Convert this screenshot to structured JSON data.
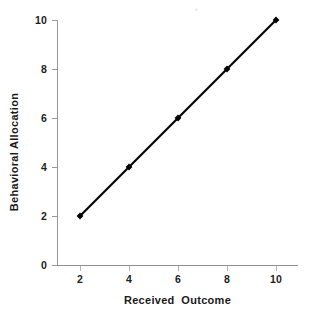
{
  "chart_data": {
    "type": "line",
    "title": "",
    "xlabel": "Received  Outcome",
    "ylabel": "Behavioral Allocation",
    "x": [
      2,
      4,
      6,
      8,
      10
    ],
    "values": [
      2,
      4,
      6,
      8,
      10
    ],
    "series": [
      {
        "name": "",
        "x": [
          2,
          4,
          6,
          8,
          10
        ],
        "values": [
          2,
          4,
          6,
          8,
          10
        ]
      }
    ],
    "xlim": [
      1,
      11
    ],
    "ylim": [
      0,
      10
    ],
    "xticks": [
      "2",
      "4",
      "6",
      "8",
      "10"
    ],
    "yticks": [
      "10",
      "8",
      "6",
      "4",
      "2",
      "0"
    ],
    "grid": false,
    "legend": "none",
    "marker": "diamond",
    "line_color": "#000000",
    "marker_color": "#000000",
    "axis_color": "#969696",
    "background": "#ffffff"
  },
  "axis": {
    "y_labels": [
      {
        "text": "10",
        "value": 10
      },
      {
        "text": "8",
        "value": 8
      },
      {
        "text": "6",
        "value": 6
      },
      {
        "text": "4",
        "value": 4
      },
      {
        "text": "2",
        "value": 2
      },
      {
        "text": "0",
        "value": 0
      }
    ],
    "x_labels": [
      {
        "text": "2",
        "value": 2
      },
      {
        "text": "4",
        "value": 4
      },
      {
        "text": "6",
        "value": 6
      },
      {
        "text": "8",
        "value": 8
      },
      {
        "text": "10",
        "value": 10
      }
    ]
  }
}
